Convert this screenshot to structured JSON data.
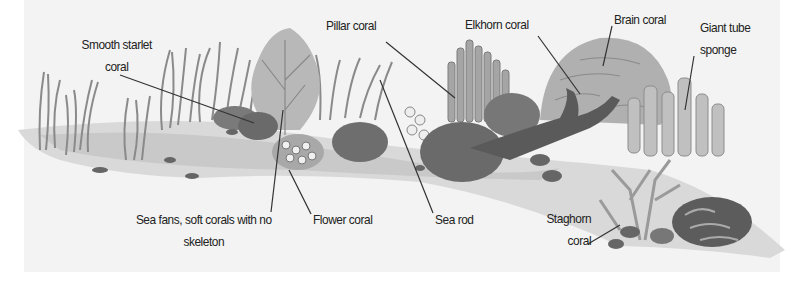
{
  "diagram": {
    "colors": {
      "panel": "#f3f3f3",
      "ink": "#222222",
      "leader": "#333333"
    },
    "labels": [
      {
        "id": "smooth-starlet-coral",
        "lines": [
          "Smooth starlet",
          "coral"
        ]
      },
      {
        "id": "pillar-coral",
        "lines": [
          "Pillar coral"
        ]
      },
      {
        "id": "elkhorn-coral",
        "lines": [
          "Elkhorn coral"
        ]
      },
      {
        "id": "brain-coral",
        "lines": [
          "Brain coral"
        ]
      },
      {
        "id": "giant-tube-sponge",
        "lines": [
          "Giant tube",
          "sponge"
        ]
      },
      {
        "id": "sea-fans",
        "lines": [
          "Sea fans, soft corals with no",
          "skeleton"
        ]
      },
      {
        "id": "flower-coral",
        "lines": [
          "Flower coral"
        ]
      },
      {
        "id": "sea-rod",
        "lines": [
          "Sea rod"
        ]
      },
      {
        "id": "staghorn-coral",
        "lines": [
          "Staghorn",
          "coral"
        ]
      }
    ]
  }
}
